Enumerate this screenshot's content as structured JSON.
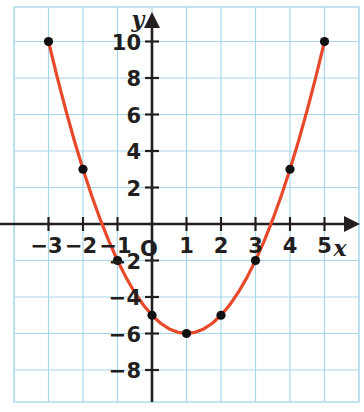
{
  "chart_data": {
    "type": "line",
    "title": "",
    "subtitle": "",
    "xlabel": "x",
    "ylabel": "y",
    "equation_display": "y = x² − 2x − 5",
    "curve_color": "#e8492b",
    "grid_color": "#a9d7ea",
    "axis_color": "#231f20",
    "point_color": "#111111",
    "background_color": "#ffffff",
    "grid": true,
    "legend": "none",
    "xlim": [
      -4,
      6
    ],
    "ylim": [
      -10,
      11
    ],
    "x_tick_labels": [
      "−3",
      "−2",
      "−1",
      "1",
      "2",
      "3",
      "4",
      "5"
    ],
    "x_tick_values": [
      -3,
      -2,
      -1,
      1,
      2,
      3,
      4,
      5
    ],
    "y_tick_labels": [
      "10",
      "8",
      "6",
      "4",
      "2",
      "−2",
      "−4",
      "−6",
      "−8"
    ],
    "y_tick_values": [
      10,
      8,
      6,
      4,
      2,
      -2,
      -4,
      -6,
      -8
    ],
    "origin_label": "O",
    "x_axis_label": "x",
    "y_axis_label": "y",
    "points": [
      {
        "x": -3,
        "y": 10,
        "label": "(−3, 10)"
      },
      {
        "x": -2,
        "y": 3,
        "label": "(−2, 3)"
      },
      {
        "x": -1,
        "y": -2,
        "label": "(−1, −2)"
      },
      {
        "x": 0,
        "y": -5,
        "label": "(0, −5)"
      },
      {
        "x": 1,
        "y": -6,
        "label": "(1, −6)"
      },
      {
        "x": 2,
        "y": -5,
        "label": "(2, −5)"
      },
      {
        "x": 3,
        "y": -2,
        "label": "(3, −2)"
      },
      {
        "x": 4,
        "y": 3,
        "label": "(4, 3)"
      },
      {
        "x": 5,
        "y": 10,
        "label": "(5, 10)"
      }
    ],
    "vertex": {
      "x": 1,
      "y": -6
    },
    "curve_samples_x": [
      -3,
      -2.75,
      -2.5,
      -2.25,
      -2,
      -1.75,
      -1.5,
      -1.25,
      -1,
      -0.75,
      -0.5,
      -0.25,
      0,
      0.25,
      0.5,
      0.75,
      1,
      1.25,
      1.5,
      1.75,
      2,
      2.25,
      2.5,
      2.75,
      3,
      3.25,
      3.5,
      3.75,
      4,
      4.25,
      4.5,
      4.75,
      5
    ]
  }
}
